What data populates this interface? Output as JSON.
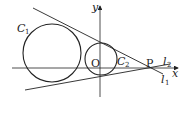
{
  "diagram": {
    "axes": {
      "x_label": "x",
      "y_label": "y",
      "origin_label": "O"
    },
    "circles": [
      {
        "name": "C",
        "sub": "1",
        "cx": 52,
        "cy": 53,
        "r": 29
      },
      {
        "name": "C",
        "sub": "2",
        "cx": 101,
        "cy": 59,
        "r": 16
      }
    ],
    "lines": [
      {
        "name": "l",
        "sub": "1"
      },
      {
        "name": "l",
        "sub": "2"
      }
    ],
    "point": {
      "label": "P"
    },
    "colors": {
      "stroke": "#222222",
      "background": "#ffffff"
    }
  }
}
